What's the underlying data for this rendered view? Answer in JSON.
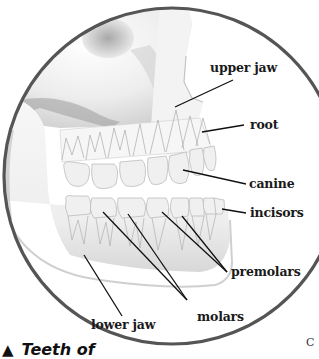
{
  "figure": {
    "type": "anatomical-illustration",
    "frame": {
      "shape": "circle",
      "stroke_color": "#555555"
    },
    "colors": {
      "bone_light": "#f4f4f4",
      "bone_shadow": "#bdbdbd",
      "tooth_fill": "#f2f2f2",
      "tooth_outline": "#a8a8a8",
      "leader_line": "#111111",
      "label_text": "#1a1a1a"
    }
  },
  "labels": {
    "upper_jaw": "upper jaw",
    "root": "root",
    "canine": "canine",
    "incisors": "incisors",
    "premolars": "premolars",
    "molars": "molars",
    "lower_jaw": "lower jaw"
  },
  "caption": {
    "marker": "▲",
    "text": "Teeth of"
  },
  "page_letter": "C"
}
